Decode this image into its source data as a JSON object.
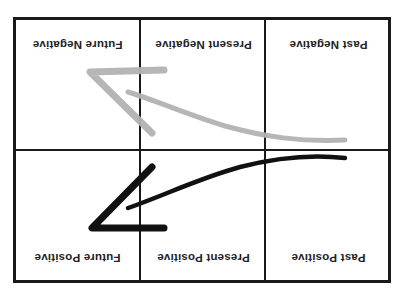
{
  "diagram": {
    "orientation": "rotated 180 degrees",
    "rows": [
      {
        "row": "top",
        "cells": [
          {
            "label": "Future Negative"
          },
          {
            "label": "Present Negative"
          },
          {
            "label": "Past Negative"
          }
        ]
      },
      {
        "row": "bottom",
        "cells": [
          {
            "label": "Future Positive"
          },
          {
            "label": "Present Positive"
          },
          {
            "label": "Past Positive"
          }
        ]
      }
    ],
    "arrows": [
      {
        "name": "negative-trajectory",
        "color": "#b3b3b3",
        "from": "Past Negative",
        "to": "Future Negative"
      },
      {
        "name": "positive-trajectory",
        "color": "#111111",
        "from": "Past Positive",
        "to": "Future Positive"
      }
    ],
    "colors": {
      "grid": "#1a1a1a",
      "text": "#222222",
      "gray_arrow": "#b3b3b3",
      "black_arrow": "#111111"
    }
  }
}
